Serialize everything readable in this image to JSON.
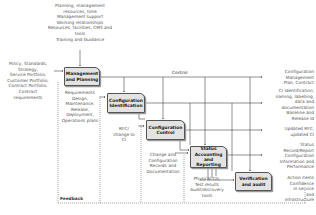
{
  "diagram": {
    "top_inputs": [
      "Planning, management",
      "resources, time",
      "Management support",
      "Working relationships",
      "Resources, facilities, CMS and",
      "tools",
      "Training and Guidance"
    ],
    "left_inputs": [
      "Policy, Standards,",
      "Strategy,",
      "Service Portfolio,",
      "Customer Portfolio,",
      "Contract Portfolio,",
      "Contract",
      "requirements"
    ],
    "control_label": "Control",
    "feedback_label": "Feedback",
    "boxes": [
      {
        "label": "Management and Planning"
      },
      {
        "label": "Configuration Identification"
      },
      {
        "label": "Configuration Control"
      },
      {
        "label": "Status Accounting and Reporting"
      },
      {
        "label": "Verification and audit"
      }
    ],
    "box_inputs": {
      "identification": [
        "Requirements",
        "Design,",
        "Maintenance,",
        "Release,",
        "Deployment,",
        "Operations plans"
      ],
      "control": [
        "RFC/",
        "change to",
        "CI"
      ],
      "status": [
        "Change and",
        "Configuration",
        "Records and",
        "Documentation"
      ],
      "verification": [
        "Physical CIs,",
        "Test results",
        "Audit/discovery",
        "tools"
      ]
    },
    "outputs": [
      {
        "lines": [
          "Configuration",
          "Management",
          "Plan, Contract"
        ]
      },
      {
        "lines": [
          "CI Identification,",
          "naming, labelling,",
          "data and",
          "documentation",
          "Baseline and",
          "Release Id"
        ]
      },
      {
        "lines": [
          "Updated RFC,",
          "updated CI"
        ]
      },
      {
        "lines": [
          "Status",
          "Record/Report",
          "Configuration",
          "Information and",
          "Performance"
        ]
      },
      {
        "lines": [
          "Action items",
          "Confidence",
          "in service",
          "and",
          "infrastructure"
        ]
      }
    ],
    "colors": {
      "box_fill": "#e3e3e3",
      "line": "#333333"
    }
  }
}
